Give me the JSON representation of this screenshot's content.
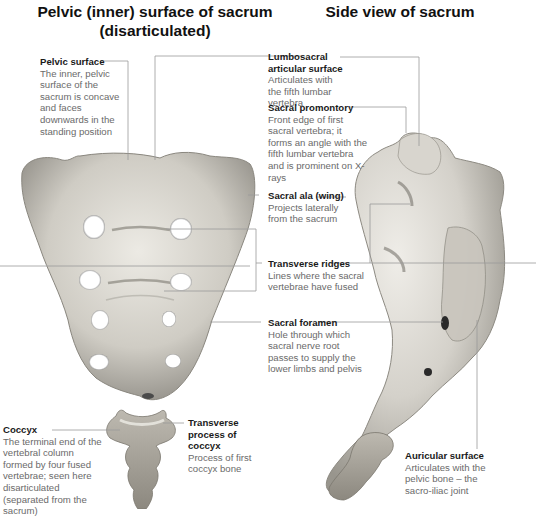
{
  "titles": {
    "left": "Pelvic (inner) surface of sacrum (disarticulated)",
    "right": "Side view of sacrum"
  },
  "figures": [
    {
      "name": "sacrum-pelvic-surface",
      "view": "Pelvic (inner) surface, disarticulated"
    },
    {
      "name": "coccyx",
      "view": "Disarticulated coccyx"
    },
    {
      "name": "sacrum-side-view",
      "view": "Side view with attached coccyx"
    }
  ],
  "labels": {
    "pelvic_surface": {
      "title": "Pelvic surface",
      "desc": "The inner, pelvic surface of the sacrum is concave and faces downwards in the standing position"
    },
    "lumbosacral": {
      "title": "Lumbosacral articular surface",
      "desc": "Articulates with the fifth lumbar vertebra"
    },
    "promontory": {
      "title": "Sacral promontory",
      "desc": "Front edge of first sacral vertebra; it forms an angle with the fifth lumbar vertebra and is prominent on X-rays"
    },
    "ala": {
      "title": "Sacral ala (wing)",
      "desc": "Projects laterally from the sacrum"
    },
    "ridges": {
      "title": "Transverse ridges",
      "desc": "Lines where the sacral vertebrae have fused"
    },
    "foramen": {
      "title": "Sacral foramen",
      "desc": "Hole through which sacral nerve root passes to supply the lower limbs and pelvis"
    },
    "coccyx": {
      "title": "Coccyx",
      "desc": "The terminal end of the vertebral column formed by four fused vertebrae; seen here disarticulated (separated from the sacrum)"
    },
    "transverse_process": {
      "title": "Transverse process of coccyx",
      "desc": "Process of first coccyx bone"
    },
    "auricular": {
      "title": "Auricular surface",
      "desc": "Articulates with the pelvic bone – the sacro-iliac joint"
    }
  },
  "colors": {
    "bone_light": "#e4e2dc",
    "bone_mid": "#bdbab2",
    "bone_dark": "#7d7a73",
    "leader_line": "#9a9a9a",
    "title_text": "#111111",
    "label_title": "#1a1a1a",
    "label_desc": "#6a6a6a"
  }
}
